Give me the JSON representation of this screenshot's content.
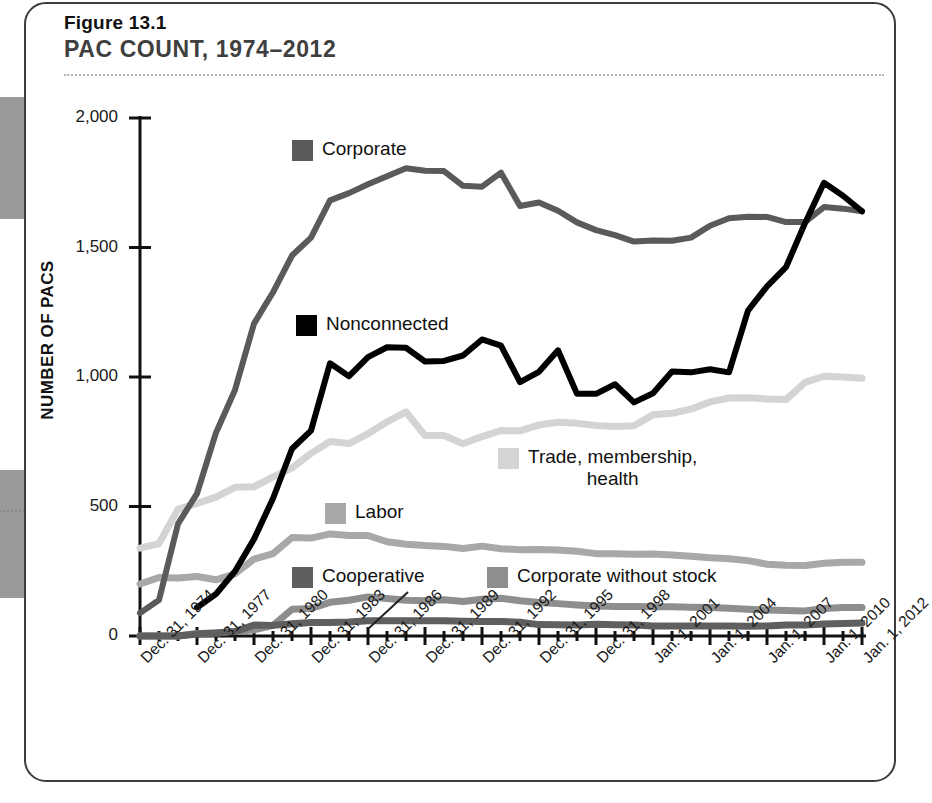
{
  "figure": {
    "number": "Figure 13.1",
    "title": "PAC COUNT, 1974–2012"
  },
  "axes": {
    "ylabel": "NUMBER OF PACS",
    "yticks": [
      "0",
      "500",
      "1,000",
      "1,500",
      "2,000"
    ],
    "xticks": [
      "Dec. 31, 1974",
      "Dec. 31, 1977",
      "Dec. 31, 1980",
      "Dec. 31, 1983",
      "Dec. 31, 1986",
      "Dec. 31, 1989",
      "Dec. 31, 1992",
      "Dec. 31, 1995",
      "Dec. 31, 1998",
      "Jan. 1, 2001",
      "Jan. 1, 2004",
      "Jan. 1, 2007",
      "Jan. 1, 2010",
      "Jan. 1, 2012"
    ]
  },
  "legend": {
    "corporate": "Corporate",
    "nonconnected": "Nonconnected",
    "trade_line1": "Trade, membership,",
    "trade_line2": "health",
    "labor": "Labor",
    "cooperative": "Cooperative",
    "corporate_without_stock": "Corporate without stock"
  },
  "colors": {
    "corporate": "#5a5a5a",
    "nonconnected": "#000000",
    "trade": "#d4d4d4",
    "labor": "#a8a8a8",
    "cooperative": "#5f5f5f",
    "corporate_without_stock": "#8e8e8e",
    "axis": "#111111",
    "card_border": "#3d3d3d",
    "title": "#3f3f3f",
    "rule": "#b5b5b5",
    "page_edge": "#9a9a9a"
  },
  "chart_data": {
    "type": "line",
    "title": "PAC COUNT, 1974–2012",
    "xlabel": "",
    "ylabel": "NUMBER OF PACS",
    "ylim": [
      0,
      2000
    ],
    "xlim": [
      1974,
      2012
    ],
    "grid": false,
    "legend_position": "inline-annotations",
    "x": [
      1974,
      1975,
      1976,
      1977,
      1978,
      1979,
      1980,
      1981,
      1982,
      1983,
      1984,
      1985,
      1986,
      1987,
      1988,
      1989,
      1990,
      1991,
      1992,
      1993,
      1994,
      1995,
      1996,
      1997,
      1998,
      1999,
      2000,
      2001,
      2002,
      2003,
      2004,
      2005,
      2006,
      2007,
      2008,
      2009,
      2010,
      2011,
      2012
    ],
    "series": [
      {
        "name": "Corporate",
        "color": "#5a5a5a",
        "values": [
          89,
          139,
          433,
          550,
          785,
          950,
          1206,
          1327,
          1469,
          1538,
          1682,
          1710,
          1744,
          1775,
          1806,
          1796,
          1795,
          1738,
          1735,
          1789,
          1660,
          1674,
          1642,
          1597,
          1567,
          1548,
          1523,
          1527,
          1526,
          1538,
          1584,
          1613,
          1619,
          1618,
          1598,
          1598,
          1656,
          1650,
          1640
        ]
      },
      {
        "name": "Nonconnected",
        "color": "#000000",
        "values": [
          null,
          null,
          null,
          110,
          162,
          250,
          374,
          531,
          723,
          793,
          1053,
          1003,
          1077,
          1115,
          1113,
          1060,
          1062,
          1083,
          1145,
          1121,
          980,
          1020,
          1103,
          935,
          935,
          972,
          902,
          937,
          1021,
          1018,
          1030,
          1018,
          1256,
          1350,
          1424,
          1594,
          1750,
          1700,
          1640
        ]
      },
      {
        "name": "Trade, membership, health",
        "color": "#d4d4d4",
        "values": [
          339,
          357,
          489,
          512,
          536,
          574,
          576,
          614,
          649,
          705,
          751,
          743,
          781,
          827,
          865,
          774,
          774,
          742,
          770,
          793,
          792,
          815,
          825,
          821,
          813,
          809,
          812,
          854,
          860,
          876,
          904,
          919,
          920,
          915,
          913,
          979,
          1003,
          1000,
          995
        ]
      },
      {
        "name": "Labor",
        "color": "#a8a8a8",
        "values": [
          201,
          226,
          224,
          230,
          217,
          240,
          297,
          318,
          380,
          378,
          394,
          388,
          388,
          364,
          354,
          349,
          346,
          338,
          347,
          337,
          333,
          334,
          332,
          327,
          318,
          318,
          316,
          317,
          313,
          308,
          302,
          298,
          291,
          277,
          273,
          272,
          281,
          285,
          285
        ]
      },
      {
        "name": "Corporate without stock",
        "color": "#8e8e8e",
        "values": [
          0,
          0,
          0,
          10,
          12,
          17,
          24,
          41,
          103,
          106,
          130,
          138,
          151,
          145,
          138,
          136,
          140,
          133,
          142,
          146,
          136,
          129,
          125,
          120,
          116,
          114,
          114,
          113,
          113,
          111,
          110,
          107,
          103,
          100,
          98,
          97,
          106,
          110,
          110
        ]
      },
      {
        "name": "Cooperative",
        "color": "#5f5f5f",
        "values": [
          0,
          0,
          0,
          8,
          12,
          17,
          42,
          41,
          47,
          52,
          52,
          54,
          59,
          59,
          59,
          59,
          59,
          57,
          56,
          56,
          53,
          44,
          43,
          42,
          45,
          43,
          42,
          39,
          39,
          39,
          39,
          39,
          38,
          39,
          42,
          42,
          46,
          48,
          50
        ]
      }
    ]
  }
}
